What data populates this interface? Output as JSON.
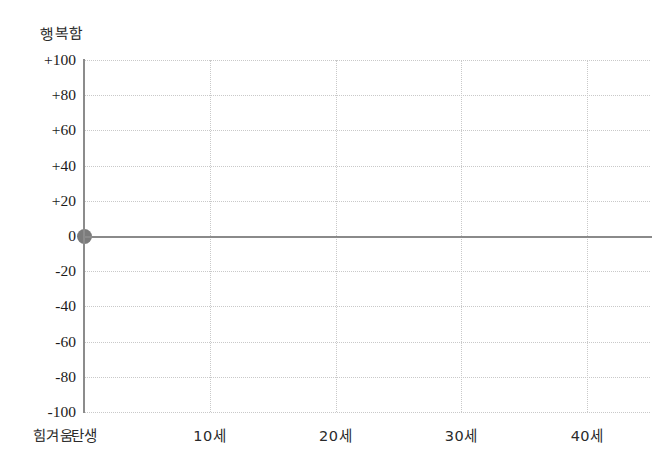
{
  "chart_data": {
    "type": "scatter",
    "title": "",
    "xlabel": "",
    "ylabel": "",
    "grid": true,
    "legend": null,
    "ylim": [
      -100,
      100
    ],
    "xlim": [
      0,
      45
    ],
    "y_ticks": [
      {
        "value": 100,
        "label": "+100"
      },
      {
        "value": 80,
        "label": "+80"
      },
      {
        "value": 60,
        "label": "+60"
      },
      {
        "value": 40,
        "label": "+40"
      },
      {
        "value": 20,
        "label": "+20"
      },
      {
        "value": 0,
        "label": "0"
      },
      {
        "value": -20,
        "label": "-20"
      },
      {
        "value": -40,
        "label": "-40"
      },
      {
        "value": -60,
        "label": "-60"
      },
      {
        "value": -80,
        "label": "-80"
      },
      {
        "value": -100,
        "label": "-100"
      }
    ],
    "x_ticks": [
      {
        "value": 0,
        "label": "탄생"
      },
      {
        "value": 10,
        "label": "10세"
      },
      {
        "value": 20,
        "label": "20세"
      },
      {
        "value": 30,
        "label": "30세"
      },
      {
        "value": 40,
        "label": "40세"
      }
    ],
    "axis_captions": {
      "y_top": "행복함",
      "y_bottom": "힘겨움"
    },
    "series": [
      {
        "name": "life-happiness",
        "marker": "circle",
        "color": "#7b7b7b",
        "points": [
          {
            "x": 0,
            "y": 0,
            "x_label": "탄생"
          }
        ]
      }
    ],
    "zero_line": {
      "value": 0,
      "color": "#8a8a8a"
    },
    "colors": {
      "axis": "#8c8c8c",
      "grid": "#c9c9c9",
      "point": "#7b7b7b",
      "text": "#1b1b1b",
      "background": "#ffffff"
    }
  }
}
